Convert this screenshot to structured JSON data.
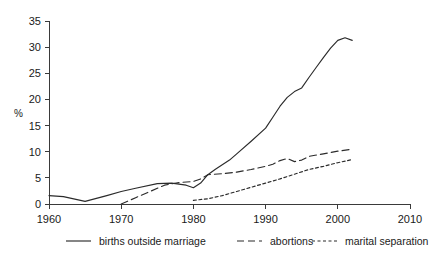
{
  "chart_data": {
    "type": "line",
    "title": "",
    "subtitle": "",
    "xlabel": "",
    "ylabel": "%",
    "xlim": [
      1960,
      2010
    ],
    "ylim": [
      0,
      35
    ],
    "x_ticks": [
      1960,
      1970,
      1980,
      1990,
      2000,
      2010
    ],
    "x_tick_labels": [
      "1960",
      "1970",
      "1980",
      "1990",
      "2000",
      "2010"
    ],
    "y_ticks": [
      0,
      5,
      10,
      15,
      20,
      25,
      30,
      35
    ],
    "y_tick_labels": [
      "0",
      "5",
      "10",
      "15",
      "20",
      "25",
      "30",
      "35"
    ],
    "grid": false,
    "legend_position": "bottom",
    "series": [
      {
        "name": "births outside marriage",
        "style": "solid",
        "dasharray": "",
        "color": "#2b2b2b",
        "x": [
          1960,
          1962,
          1965,
          1968,
          1970,
          1972,
          1975,
          1977,
          1979,
          1980,
          1981,
          1982,
          1983,
          1985,
          1986,
          1988,
          1990,
          1991,
          1992,
          1993,
          1994,
          1995,
          1996,
          1997,
          1998,
          1999,
          2000,
          2001,
          2002
        ],
        "y": [
          1.6,
          1.4,
          0.5,
          1.6,
          2.4,
          3.0,
          3.9,
          4.0,
          3.6,
          3.1,
          4.0,
          5.6,
          6.6,
          8.4,
          9.6,
          12.0,
          14.5,
          16.6,
          18.7,
          20.4,
          21.5,
          22.2,
          24.2,
          26.1,
          28.0,
          29.8,
          31.3,
          31.8,
          31.3
        ]
      },
      {
        "name": "abortions",
        "style": "long-dash",
        "dasharray": "7,4",
        "color": "#2b2b2b",
        "x": [
          1970,
          1972,
          1974,
          1976,
          1978,
          1980,
          1981,
          1982,
          1984,
          1986,
          1988,
          1990,
          1991,
          1992,
          1993,
          1994,
          1995,
          1996,
          1998,
          2000,
          2002
        ],
        "y": [
          0.0,
          1.2,
          2.4,
          3.6,
          4.1,
          4.3,
          4.8,
          5.6,
          5.8,
          6.1,
          6.6,
          7.2,
          7.6,
          8.3,
          8.7,
          8.1,
          8.4,
          9.1,
          9.6,
          10.1,
          10.5
        ]
      },
      {
        "name": "marital separation",
        "style": "short-dash",
        "dasharray": "3,2.5",
        "color": "#2b2b2b",
        "x": [
          1980,
          1982,
          1984,
          1986,
          1988,
          1990,
          1992,
          1994,
          1996,
          1998,
          2000,
          2002
        ],
        "y": [
          0.7,
          1.0,
          1.6,
          2.4,
          3.2,
          4.0,
          4.8,
          5.7,
          6.6,
          7.2,
          7.9,
          8.5
        ]
      }
    ]
  },
  "legend": {
    "items": [
      {
        "label": "births outside marriage"
      },
      {
        "label": "abortions"
      },
      {
        "label": "marital separation"
      }
    ]
  }
}
